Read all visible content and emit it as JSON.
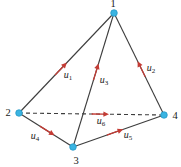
{
  "figure": {
    "width": 181,
    "height": 167,
    "background": "#ffffff",
    "colors": {
      "edge": "#3d3d3d",
      "arrow": "#c43b34",
      "vertex_fill": "#3ab4e2",
      "vertex_stroke": "#1f93c2",
      "label": "#1a1a1a"
    },
    "vertices": [
      {
        "id": "1",
        "x": 114,
        "y": 13,
        "label": "1",
        "label_x": 113,
        "label_y": 7
      },
      {
        "id": "2",
        "x": 19,
        "y": 113,
        "label": "2",
        "label_x": 8,
        "label_y": 116
      },
      {
        "id": "3",
        "x": 73,
        "y": 147,
        "label": "3",
        "label_x": 76,
        "label_y": 164
      },
      {
        "id": "4",
        "x": 164,
        "y": 115,
        "label": "4",
        "label_x": 175,
        "label_y": 119
      }
    ],
    "edges": [
      {
        "from": "2",
        "to": "1",
        "style": "solid",
        "arrow_t": 0.44,
        "label": {
          "base": "u",
          "sub": "1",
          "x": 68,
          "y": 78
        }
      },
      {
        "from": "4",
        "to": "1",
        "style": "solid",
        "arrow_t": 0.45,
        "label": {
          "base": "u",
          "sub": "2",
          "x": 151,
          "y": 71
        }
      },
      {
        "from": "3",
        "to": "1",
        "style": "solid",
        "arrow_t": 0.56,
        "label": {
          "base": "u",
          "sub": "3",
          "x": 104,
          "y": 83
        }
      },
      {
        "from": "2",
        "to": "3",
        "style": "solid",
        "arrow_t": 0.52,
        "label": {
          "base": "u",
          "sub": "4",
          "x": 35,
          "y": 139
        }
      },
      {
        "from": "3",
        "to": "4",
        "style": "solid",
        "arrow_t": 0.46,
        "label": {
          "base": "u",
          "sub": "5",
          "x": 128,
          "y": 138
        }
      },
      {
        "from": "2",
        "to": "4",
        "style": "dashed",
        "arrow_t": 0.56,
        "label": {
          "base": "u",
          "sub": "6",
          "x": 101,
          "y": 124
        }
      }
    ],
    "arrow_geometry": {
      "tail_back": 8.5,
      "head_base": 3.2,
      "tip_forward": 8.8,
      "head_half_width": 2.7,
      "shaft_width": 1.3
    },
    "vertex_radius": 3.3,
    "edge_width": 1.1,
    "dash_pattern": "4 3",
    "label_font_size": 10,
    "subscript_font_size": 7,
    "vertex_font_size": 10.5
  }
}
